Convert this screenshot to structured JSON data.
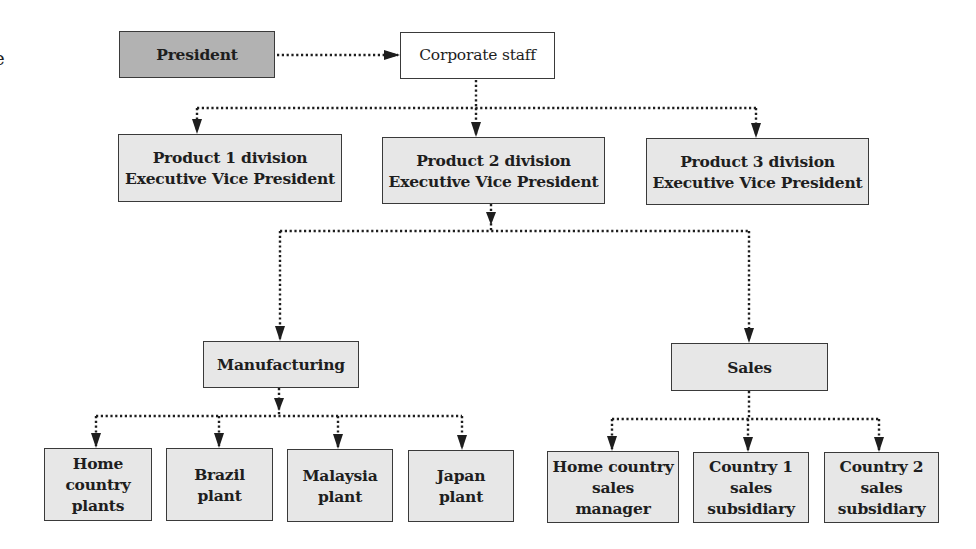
{
  "diagram": {
    "type": "organization-chart",
    "edge_fragment": "e",
    "colors": {
      "president_fill": "#b2b2b2",
      "box_fill": "#e7e7e7",
      "corporate_staff_fill": "#ffffff",
      "border": "#3a3a3a",
      "connector": "#1e1e1e"
    },
    "nodes": {
      "president": {
        "lines": [
          "President"
        ]
      },
      "corporate_staff": {
        "lines": [
          "Corporate staff"
        ]
      },
      "product1": {
        "lines": [
          "Product 1 division",
          "Executive Vice President"
        ]
      },
      "product2": {
        "lines": [
          "Product 2 division",
          "Executive Vice President"
        ]
      },
      "product3": {
        "lines": [
          "Product 3 division",
          "Executive Vice President"
        ]
      },
      "manufacturing": {
        "lines": [
          "Manufacturing"
        ]
      },
      "sales": {
        "lines": [
          "Sales"
        ]
      },
      "home_plants": {
        "lines": [
          "Home",
          "country",
          "plants"
        ]
      },
      "brazil": {
        "lines": [
          "Brazil",
          "plant"
        ]
      },
      "malaysia": {
        "lines": [
          "Malaysia",
          "plant"
        ]
      },
      "japan": {
        "lines": [
          "Japan",
          "plant"
        ]
      },
      "home_sales": {
        "lines": [
          "Home country",
          "sales",
          "manager"
        ]
      },
      "country1": {
        "lines": [
          "Country 1",
          "sales",
          "subsidiary"
        ]
      },
      "country2": {
        "lines": [
          "Country 2",
          "sales",
          "subsidiary"
        ]
      }
    },
    "edges": [
      [
        "president",
        "corporate_staff"
      ],
      [
        "corporate_staff",
        "product1"
      ],
      [
        "corporate_staff",
        "product2"
      ],
      [
        "corporate_staff",
        "product3"
      ],
      [
        "product2",
        "manufacturing"
      ],
      [
        "product2",
        "sales"
      ],
      [
        "manufacturing",
        "home_plants"
      ],
      [
        "manufacturing",
        "brazil"
      ],
      [
        "manufacturing",
        "malaysia"
      ],
      [
        "manufacturing",
        "japan"
      ],
      [
        "sales",
        "home_sales"
      ],
      [
        "sales",
        "country1"
      ],
      [
        "sales",
        "country2"
      ]
    ]
  }
}
